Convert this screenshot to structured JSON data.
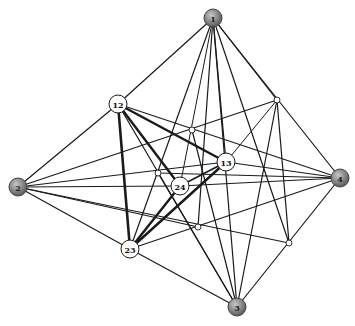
{
  "diagram": {
    "type": "graph",
    "nodes": [
      {
        "id": "1",
        "label": "1",
        "x": 213,
        "y": 18,
        "kind": "outer",
        "fill": "#8a8a8a",
        "r": 9
      },
      {
        "id": "2",
        "label": "2",
        "x": 18,
        "y": 187,
        "kind": "outer",
        "fill": "#7a7a7a",
        "r": 9
      },
      {
        "id": "3",
        "label": "3",
        "x": 237,
        "y": 307,
        "kind": "outer",
        "fill": "#9a9a9a",
        "r": 9
      },
      {
        "id": "4",
        "label": "4",
        "x": 340,
        "y": 178,
        "kind": "outer",
        "fill": "#6e6e6e",
        "r": 9
      },
      {
        "id": "12",
        "label": "12",
        "x": 118,
        "y": 104,
        "kind": "inner",
        "fill": "#ffffff",
        "r": 9
      },
      {
        "id": "13",
        "label": "13",
        "x": 226,
        "y": 162,
        "kind": "inner",
        "fill": "#ffffff",
        "r": 9
      },
      {
        "id": "24",
        "label": "24",
        "x": 180,
        "y": 186,
        "kind": "inner",
        "fill": "#ffffff",
        "r": 9
      },
      {
        "id": "23",
        "label": "23",
        "x": 130,
        "y": 249,
        "kind": "inner",
        "fill": "#ffffff",
        "r": 9
      },
      {
        "id": "a",
        "label": "",
        "x": 277,
        "y": 100,
        "kind": "small",
        "fill": "#ffffff",
        "r": 3
      },
      {
        "id": "b",
        "label": "",
        "x": 192,
        "y": 130,
        "kind": "small",
        "fill": "#ffffff",
        "r": 3
      },
      {
        "id": "c",
        "label": "",
        "x": 158,
        "y": 173,
        "kind": "small",
        "fill": "#ffffff",
        "r": 3
      },
      {
        "id": "d",
        "label": "",
        "x": 198,
        "y": 227,
        "kind": "small",
        "fill": "#ffffff",
        "r": 3
      },
      {
        "id": "e",
        "label": "",
        "x": 289,
        "y": 243,
        "kind": "small",
        "fill": "#ffffff",
        "r": 3
      }
    ],
    "edges": [
      {
        "from": "1",
        "to": "12",
        "w": 1.2
      },
      {
        "from": "1",
        "to": "4",
        "w": 1.2
      },
      {
        "from": "1",
        "to": "a",
        "w": 1.2
      },
      {
        "from": "1",
        "to": "13",
        "w": 1.2
      },
      {
        "from": "1",
        "to": "23",
        "w": 1.2
      },
      {
        "from": "1",
        "to": "d",
        "w": 1.2
      },
      {
        "from": "1",
        "to": "3",
        "w": 1.2
      },
      {
        "from": "1",
        "to": "e",
        "w": 1.2
      },
      {
        "from": "1",
        "to": "24",
        "w": 1.0
      },
      {
        "from": "2",
        "to": "12",
        "w": 1.2
      },
      {
        "from": "2",
        "to": "23",
        "w": 1.2
      },
      {
        "from": "2",
        "to": "a",
        "w": 1.2
      },
      {
        "from": "2",
        "to": "13",
        "w": 1.2
      },
      {
        "from": "2",
        "to": "24",
        "w": 1.2
      },
      {
        "from": "2",
        "to": "d",
        "w": 1.2
      },
      {
        "from": "2",
        "to": "e",
        "w": 1.2
      },
      {
        "from": "4",
        "to": "12",
        "w": 1.2
      },
      {
        "from": "4",
        "to": "13",
        "w": 1.2
      },
      {
        "from": "4",
        "to": "23",
        "w": 1.2
      },
      {
        "from": "4",
        "to": "24",
        "w": 1.2
      },
      {
        "from": "4",
        "to": "3",
        "w": 1.2
      },
      {
        "from": "4",
        "to": "c",
        "w": 1.2
      },
      {
        "from": "3",
        "to": "23",
        "w": 1.2
      },
      {
        "from": "3",
        "to": "12",
        "w": 1.2
      },
      {
        "from": "3",
        "to": "a",
        "w": 1.2
      },
      {
        "from": "3",
        "to": "b",
        "w": 1.2
      },
      {
        "from": "3",
        "to": "c",
        "w": 1.2
      },
      {
        "from": "12",
        "to": "13",
        "w": 2.4
      },
      {
        "from": "12",
        "to": "24",
        "w": 2.4
      },
      {
        "from": "12",
        "to": "23",
        "w": 2.6
      },
      {
        "from": "13",
        "to": "23",
        "w": 2.4
      },
      {
        "from": "24",
        "to": "23",
        "w": 2.4
      },
      {
        "from": "13",
        "to": "24",
        "w": 1.6
      },
      {
        "from": "a",
        "to": "e",
        "w": 1.2
      },
      {
        "from": "a",
        "to": "13",
        "w": 1.0
      }
    ],
    "stroke": "#1a1a1a",
    "outer_stroke": "#444444"
  }
}
